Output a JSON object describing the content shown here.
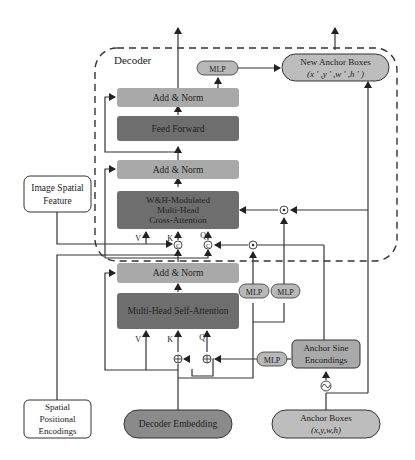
{
  "diagram": {
    "container_label": "Decoder",
    "colors": {
      "add_norm": "#a9a9a9",
      "dark_block": "#6e6e6e",
      "mlp": "#b8b8b8",
      "anchor_box": "#bdbdbd",
      "decoder_embedding": "#8a8a8a",
      "line": "#333333"
    },
    "blocks": {
      "add_norm_top": "Add & Norm",
      "feed_forward": "Feed Forward",
      "add_norm_mid": "Add & Norm",
      "cross_attention": [
        "W&H-Modulated",
        "Multi-Head",
        "Cross-Attention"
      ],
      "add_norm_bottom": "Add & Norm",
      "self_attention": "Multi-Head Self-Attention"
    },
    "mlps": {
      "top": "MLP",
      "mid_left": "MLP",
      "mid_right": "MLP",
      "bottom": "MLP"
    },
    "inputs": {
      "image_spatial_feature": [
        "Image Spatial",
        "Feature"
      ],
      "spatial_positional_encodings": [
        "Spatial",
        "Positional",
        "Encodings"
      ],
      "decoder_embedding": "Decoder Embedding",
      "anchor_boxes": [
        "Anchor Boxes",
        "(x,y,w,h)"
      ]
    },
    "outputs": {
      "new_anchor_boxes": [
        "New Anchor Boxes",
        "(x ′ ,y ′ ,w ′ ,h ′ )"
      ]
    },
    "anchor_sine": [
      "Anchor Sine",
      "Encondings"
    ],
    "port_labels": {
      "cross_v": "V",
      "cross_k": "K",
      "cross_q": "Q",
      "self_v": "V",
      "self_k": "K",
      "self_q": "Q"
    },
    "operators": {
      "concat": "C",
      "add": "+",
      "multiply": "⊙",
      "sine": "~"
    }
  }
}
